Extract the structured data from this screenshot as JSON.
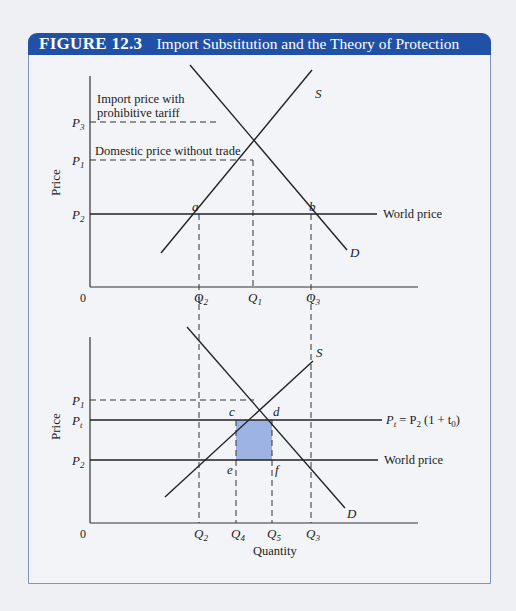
{
  "figure": {
    "number": "FIGURE 12.3",
    "title": "Import Substitution and the Theory of Protection",
    "accent_color": "#2051a6",
    "frame_color": "#7f93bf",
    "shade_color": "#9db3e4"
  },
  "top_panel": {
    "y_axis_label": "Price",
    "origin_label": "0",
    "price_labels": {
      "p3": "P",
      "p3_sub": "3",
      "p1": "P",
      "p1_sub": "1",
      "p2": "P",
      "p2_sub": "2"
    },
    "annotations": {
      "import_price_line1": "Import price with",
      "import_price_line2": "prohibitive tariff",
      "domestic_price": "Domestic price without trade",
      "world_price": "World price"
    },
    "quantity_labels": {
      "q2": "Q",
      "q2_sub": "2",
      "q1": "Q",
      "q1_sub": "1",
      "q3": "Q",
      "q3_sub": "3"
    },
    "points": {
      "a": "a",
      "b": "b"
    },
    "curves": {
      "supply": "S",
      "demand": "D"
    }
  },
  "bottom_panel": {
    "y_axis_label": "Price",
    "x_axis_label": "Quantity",
    "origin_label": "0",
    "price_labels": {
      "p1": "P",
      "p1_sub": "1",
      "pt": "P",
      "pt_sub": "t",
      "p2": "P",
      "p2_sub": "2"
    },
    "annotations": {
      "tariff_price_eq_a": "P",
      "tariff_price_eq_a_sub": "t",
      "tariff_price_eq_b": " = P",
      "tariff_price_eq_b_sub": "2",
      "tariff_price_eq_c": " (1 + t",
      "tariff_price_eq_c_sub": "0",
      "tariff_price_eq_d": ")",
      "world_price": "World price"
    },
    "quantity_labels": {
      "q2": "Q",
      "q2_sub": "2",
      "q4": "Q",
      "q4_sub": "4",
      "q5": "Q",
      "q5_sub": "5",
      "q3": "Q",
      "q3_sub": "3"
    },
    "points": {
      "c": "c",
      "d": "d",
      "e": "e",
      "f": "f"
    },
    "curves": {
      "supply": "S",
      "demand": "D"
    }
  }
}
